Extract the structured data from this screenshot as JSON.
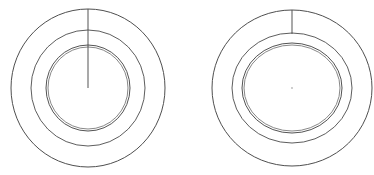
{
  "canvas": {
    "width": 374,
    "height": 175,
    "background_color": "#ffffff",
    "line_color": "#4f4f4f",
    "figure_count": 2
  },
  "figures": [
    {
      "id": "left-figure",
      "name": "left-concentric-ring-diagram",
      "center_x": 88,
      "center_y": 88,
      "rings": [
        {
          "name": "outer-ring",
          "radius_x": 77,
          "radius_y": 79,
          "stroke": "#4f4f4f"
        },
        {
          "name": "middle-ring",
          "radius_x": 57,
          "radius_y": 58,
          "stroke": "#545454"
        },
        {
          "name": "inner-ring-outer-line",
          "radius_x": 42,
          "radius_y": 43,
          "stroke": "#4a4a4a"
        },
        {
          "name": "inner-ring-inner-line",
          "radius_x": 40,
          "radius_y": 41,
          "stroke": "#6a6a6a"
        }
      ],
      "tick": {
        "name": "vertical-tick-line",
        "x": 88,
        "y_start": 9,
        "y_end": 88,
        "description": "radial line from outer ring top to center"
      },
      "center_dot": false
    },
    {
      "id": "right-figure",
      "name": "right-concentric-ring-diagram",
      "center_x": 292,
      "center_y": 88,
      "rings": [
        {
          "name": "outer-ring",
          "radius_x": 80,
          "radius_y": 78,
          "stroke": "#4f4f4f"
        },
        {
          "name": "middle-ring",
          "radius_x": 60,
          "radius_y": 55,
          "stroke": "#545454"
        },
        {
          "name": "inner-ring-outer-line",
          "radius_x": 50,
          "radius_y": 45,
          "stroke": "#4a4a4a"
        },
        {
          "name": "inner-ring-inner-line",
          "radius_x": 48,
          "radius_y": 43,
          "stroke": "#6a6a6a"
        }
      ],
      "tick": {
        "name": "vertical-tick-line",
        "x": 292,
        "y_start": 10,
        "y_end": 34,
        "description": "short radial line from outer ring top to middle ring"
      },
      "center_dot": true,
      "center_dot_radius": 0.9,
      "center_dot_color": "#b8b8b8"
    }
  ]
}
